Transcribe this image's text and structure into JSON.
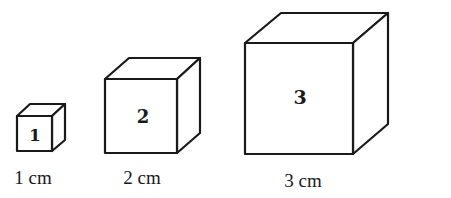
{
  "cubes": [
    {
      "id": "1",
      "label": "1",
      "caption": "1 cm"
    },
    {
      "id": "2",
      "label": "2",
      "caption": "2 cm"
    },
    {
      "id": "3",
      "label": "3",
      "caption": "3 cm"
    }
  ],
  "colors": {
    "stroke": "#1a1a1a",
    "background": "#ffffff"
  }
}
